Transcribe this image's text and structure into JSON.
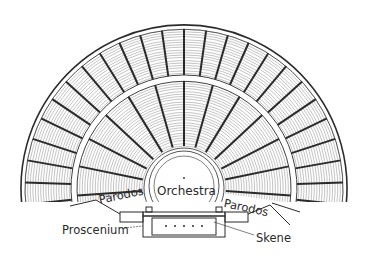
{
  "diagram": {
    "labels": {
      "orchestra": "Orchestra",
      "parodos_left": "Parodos",
      "parodos_right": "Parodos",
      "proscenium": "Proscenium",
      "skene": "Skene"
    },
    "geometry": {
      "center": [
        184,
        188
      ],
      "outer_radius": 163,
      "diazoma_radius": 110,
      "inner_seating_radius": 38,
      "orchestra_radius": 30
    },
    "colors": {
      "ink": "#2a2a2a",
      "seating_hatch": "#6e6e6e",
      "background": "#ffffff"
    }
  }
}
